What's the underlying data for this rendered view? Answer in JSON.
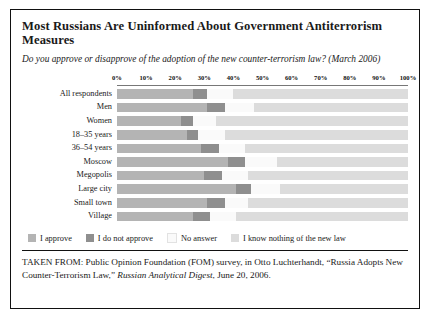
{
  "title": "Most Russians Are Uninformed About Government Antiterrorism Measures",
  "subtitle": "Do you approve or disapprove of the adoption of the new counter-terrorism law? (March 2006)",
  "source": {
    "prefix": "TAKEN FROM: Public Opinion Foundation (FOM) survey, in Otto Luchterhandt, “Russia Adopts New Counter-Terrorism Law,” ",
    "italic": "Russian Analytical Digest",
    "suffix": ", June 20, 2006."
  },
  "colors": {
    "approve": "#b4b4b4",
    "do_not_approve": "#8f8f8f",
    "no_answer": "#fafafa",
    "know_nothing": "#dcdcdc",
    "border": "#111111",
    "axis": "#777777"
  },
  "chart_data": {
    "type": "bar",
    "orientation": "horizontal",
    "stacked": true,
    "stack_total": 100,
    "title": "Most Russians Are Uninformed About Government Antiterrorism Measures",
    "subtitle": "Do you approve or disapprove of the adoption of the new counter-terrorism law? (March 2006)",
    "xlabel": "",
    "ylabel": "",
    "xlim": [
      0,
      100
    ],
    "grid": false,
    "legend_position": "bottom",
    "tick_labels": [
      "0%",
      "10%",
      "20%",
      "30%",
      "40%",
      "50%",
      "60%",
      "70%",
      "80%",
      "90%",
      "100%"
    ],
    "tick_values": [
      0,
      10,
      20,
      30,
      40,
      50,
      60,
      70,
      80,
      90,
      100
    ],
    "categories": [
      "All respondents",
      "Men",
      "Women",
      "18–35 years",
      "36–54 years",
      "Moscow",
      "Megopolis",
      "Large city",
      "Small town",
      "Village"
    ],
    "series": [
      {
        "name": "I approve",
        "color": "#b4b4b4",
        "values": [
          26,
          31,
          22,
          24,
          29,
          38,
          30,
          41,
          31,
          26
        ]
      },
      {
        "name": "I do not approve",
        "color": "#8f8f8f",
        "values": [
          5,
          6,
          4,
          4,
          6,
          6,
          6,
          5,
          6,
          6
        ]
      },
      {
        "name": "No answer",
        "color": "#fafafa",
        "values": [
          9,
          10,
          8,
          9,
          9,
          11,
          9,
          10,
          8,
          9
        ]
      },
      {
        "name": "I know nothing of the new law",
        "color": "#dcdcdc",
        "values": [
          60,
          53,
          66,
          63,
          56,
          45,
          55,
          44,
          55,
          59
        ]
      }
    ]
  }
}
